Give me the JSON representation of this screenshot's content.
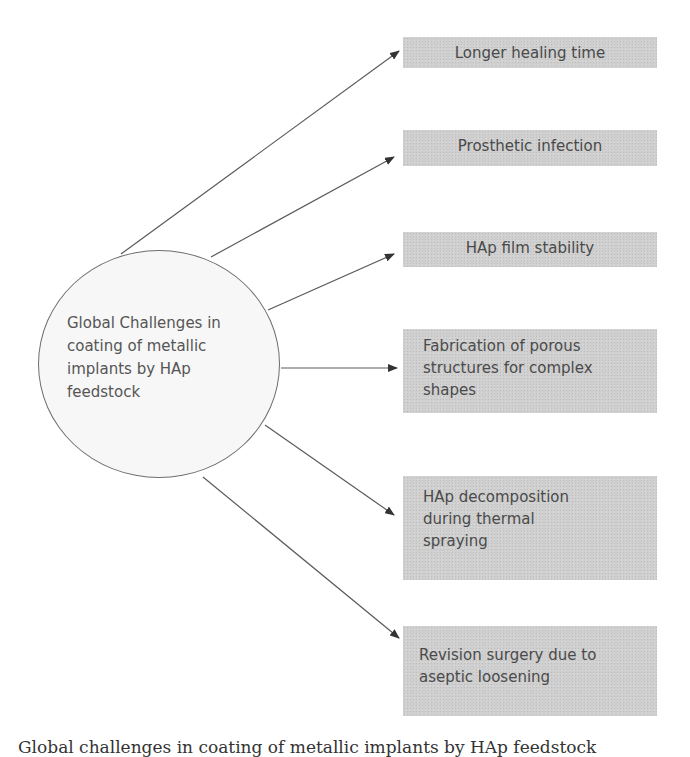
{
  "diagram": {
    "center_node": {
      "label": "Global Challenges in coating of metallic implants by HAp feedstock",
      "lines": [
        "Global Challenges in",
        "coating of metallic",
        "implants by HAp",
        "feedstock"
      ]
    },
    "challenges": [
      {
        "label": "Longer healing time"
      },
      {
        "label": "Prosthetic infection"
      },
      {
        "label": "HAp film stability"
      },
      {
        "label": "Fabrication of porous structures for complex shapes"
      },
      {
        "label": "HAp decomposition during thermal spraying"
      },
      {
        "label": "Revision surgery due to aseptic loosening"
      }
    ],
    "colors": {
      "box_fill": "#cfcfcf",
      "box_text": "#4a4a4a",
      "arrow": "#555555",
      "circle_border": "#6e6e6e"
    }
  },
  "caption": "Global challenges in coating of metallic implants by HAp feedstock"
}
